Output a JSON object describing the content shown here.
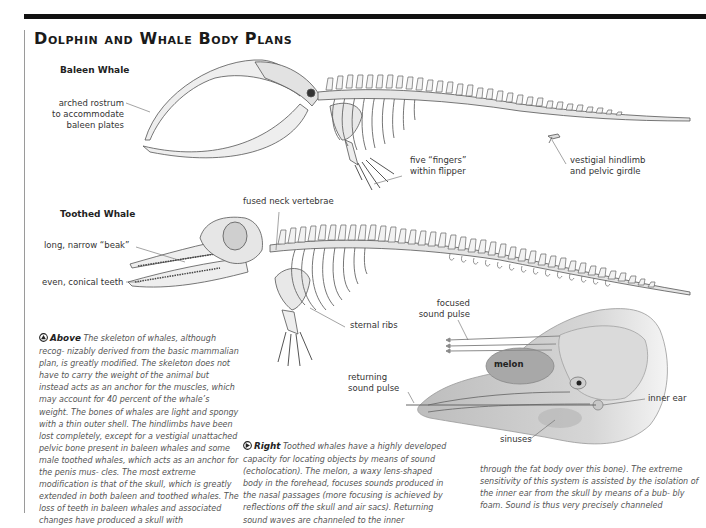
{
  "page": {
    "title": "Dolphin and Whale Body Plans"
  },
  "baleen": {
    "heading": "Baleen Whale",
    "labels": {
      "rostrum": [
        "arched rostrum",
        "to accommodate",
        "baleen plates"
      ],
      "fingers": [
        "five “fingers”",
        "within flipper"
      ],
      "hindlimb": [
        "vestigial hindlimb",
        "and pelvic girdle"
      ]
    }
  },
  "toothed": {
    "heading": "Toothed Whale",
    "labels": {
      "neck": "fused neck vertebrae",
      "beak": "long, narrow “beak”",
      "teeth": "even, conical teeth",
      "sternal": "sternal ribs"
    }
  },
  "dolphin_head": {
    "labels": {
      "focused": [
        "focused",
        "sound pulse"
      ],
      "returning": [
        "returning",
        "sound pulse"
      ],
      "melon": "melon",
      "inner_ear": "inner ear",
      "sinuses": "sinuses"
    }
  },
  "captions": {
    "above": {
      "icon": "arrow-up-icon",
      "lead": "Above",
      "text": "The skeleton of whales, although recog- nizably derived from the basic mammalian plan, is greatly modified. The skeleton does not have to carry the weight of the animal but instead acts as an anchor for the muscles, which may account for 40 percent of the whale’s weight. The bones of whales are light and spongy with a thin outer shell. The hindlimbs have been lost completely, except for a vestigial unattached pelvic bone present in baleen whales and some male toothed whales, which acts as an anchor for the penis mus- cles. The most extreme modification is that of the skull, which is greatly extended in both baleen and toothed whales. The loss of teeth in baleen whales and associated changes have produced a skull with"
    },
    "right": {
      "icon": "arrow-right-icon",
      "lead": "Right",
      "text": "Toothed whales have a highly developed capacity for locating objects by means of sound (echolocation). The melon, a waxy lens-shaped body in the forehead, focuses sounds produced in the nasal passages (more focusing is achieved by reflections off the skull and air sacs). Returning sound waves are channeled to the inner"
    },
    "continued": {
      "text": "through the fat body over this bone). The extreme sensitivity of this system is assisted by the isolation of the inner ear from the skull by means of a bub- bly foam. Sound is thus very precisely channeled"
    }
  }
}
